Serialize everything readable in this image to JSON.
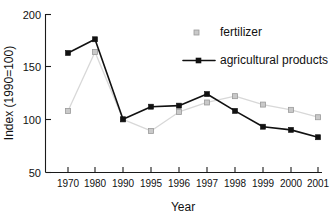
{
  "chart_data": {
    "type": "line",
    "title": "",
    "xlabel": "Year",
    "ylabel": "Index (1990=100)",
    "categories": [
      "1970",
      "1980",
      "1990",
      "1995",
      "1996",
      "1997",
      "1998",
      "1999",
      "2000",
      "2001"
    ],
    "ylim": [
      50,
      200
    ],
    "yticks": [
      50,
      100,
      150,
      200
    ],
    "ytick_labels": [
      "50",
      "100",
      "150",
      "200"
    ],
    "grid": false,
    "legend_position": "top-right",
    "series": [
      {
        "name": "fertilizer",
        "color": "#c9c9c9",
        "marker": "square-open",
        "line_style": "solid-light",
        "values": [
          108,
          164,
          100,
          89,
          107,
          116,
          122,
          114,
          109,
          102
        ]
      },
      {
        "name": "agricultural products",
        "color": "#111111",
        "marker": "square-filled",
        "line_style": "solid",
        "values": [
          163,
          176,
          100,
          112,
          113,
          124,
          108,
          93,
          90,
          83
        ]
      }
    ]
  },
  "legend": {
    "items": [
      {
        "label": "fertilizer"
      },
      {
        "label": "agricultural products"
      }
    ]
  },
  "axes": {
    "x_title": "Year",
    "y_title": "Index (1990=100)"
  }
}
